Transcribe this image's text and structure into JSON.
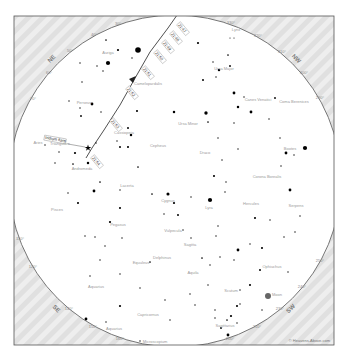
{
  "chart": {
    "colors": {
      "background": "#ffffff",
      "horizon_fill": "#e6e6e6",
      "horizon_line": "#555555",
      "track": "#222222",
      "stars": "#000000",
      "labels": "#9a9a9a"
    },
    "frame": {
      "x": 14,
      "y": 16,
      "w": 320,
      "h": 329
    },
    "sky_circle": {
      "cx": 175,
      "cy": 181,
      "r": 166
    },
    "cardinal_labels": [
      {
        "label": "NE",
        "x": 53,
        "y": 60,
        "rot": -45
      },
      {
        "label": "NW",
        "x": 295,
        "y": 60,
        "rot": 45
      },
      {
        "label": "SE",
        "x": 55,
        "y": 310,
        "rot": 45
      },
      {
        "label": "SW",
        "x": 292,
        "y": 310,
        "rot": -45
      }
    ],
    "degree_labels": [
      {
        "label": "30°",
        "x": 118,
        "y": 25
      },
      {
        "label": "40°",
        "x": 94,
        "y": 36
      },
      {
        "label": "50°",
        "x": 70,
        "y": 52
      },
      {
        "label": "60°",
        "x": 49,
        "y": 74
      },
      {
        "label": "70°",
        "x": 33,
        "y": 100
      },
      {
        "label": "330°",
        "x": 231,
        "y": 24
      },
      {
        "label": "320°",
        "x": 258,
        "y": 37
      },
      {
        "label": "310°",
        "x": 282,
        "y": 53
      },
      {
        "label": "300°",
        "x": 304,
        "y": 74
      },
      {
        "label": "290°",
        "x": 320,
        "y": 99
      },
      {
        "label": "110°",
        "x": 20,
        "y": 240
      },
      {
        "label": "120°",
        "x": 33,
        "y": 268
      },
      {
        "label": "140°",
        "x": 69,
        "y": 310
      },
      {
        "label": "150°",
        "x": 93,
        "y": 328
      },
      {
        "label": "160°",
        "x": 120,
        "y": 340
      },
      {
        "label": "200°",
        "x": 230,
        "y": 340
      },
      {
        "label": "210°",
        "x": 257,
        "y": 328
      },
      {
        "label": "230°",
        "x": 280,
        "y": 310
      },
      {
        "label": "240°",
        "x": 302,
        "y": 288
      },
      {
        "label": "250°",
        "x": 320,
        "y": 262
      }
    ],
    "satellite": {
      "name": "Iridium flare",
      "label": "Iridium flare",
      "track_points": [
        [
          182,
          8
        ],
        [
          168,
          28
        ],
        [
          150,
          52
        ],
        [
          134,
          80
        ],
        [
          120,
          105
        ],
        [
          104,
          130
        ],
        [
          92,
          148
        ],
        [
          86,
          158
        ]
      ],
      "time_labels": [
        {
          "text": "21:47",
          "x": 178,
          "y": 25
        },
        {
          "text": "21:48",
          "x": 171,
          "y": 34
        },
        {
          "text": "21:49",
          "x": 163,
          "y": 43
        },
        {
          "text": "21:50",
          "x": 155,
          "y": 53
        },
        {
          "text": "21:51",
          "x": 143,
          "y": 69
        },
        {
          "text": "21:52",
          "x": 127,
          "y": 89
        },
        {
          "text": "21:53",
          "x": 111,
          "y": 121
        },
        {
          "text": "21:54",
          "x": 92,
          "y": 158
        }
      ],
      "flare_marker": {
        "x": 88,
        "y": 148
      }
    },
    "constellations": [
      {
        "name": "Auriga",
        "x": 108,
        "y": 54
      },
      {
        "name": "Lynx",
        "x": 236,
        "y": 31
      },
      {
        "name": "Camelopardalis",
        "x": 148,
        "y": 85
      },
      {
        "name": "Perseus",
        "x": 84,
        "y": 104
      },
      {
        "name": "Ursa Major",
        "x": 224,
        "y": 70
      },
      {
        "name": "Canes Venatici",
        "x": 258,
        "y": 101
      },
      {
        "name": "Coma Berenices",
        "x": 294,
        "y": 103
      },
      {
        "name": "Ursa Minor",
        "x": 188,
        "y": 125
      },
      {
        "name": "Cassiopeia",
        "x": 124,
        "y": 134
      },
      {
        "name": "Cepheus",
        "x": 158,
        "y": 147
      },
      {
        "name": "Draco",
        "x": 205,
        "y": 154
      },
      {
        "name": "Triangulum",
        "x": 60,
        "y": 145
      },
      {
        "name": "Aries",
        "x": 38,
        "y": 144
      },
      {
        "name": "Andromeda",
        "x": 82,
        "y": 170
      },
      {
        "name": "Bootes",
        "x": 290,
        "y": 150
      },
      {
        "name": "Corona Borealis",
        "x": 267,
        "y": 178
      },
      {
        "name": "Lacerta",
        "x": 127,
        "y": 187
      },
      {
        "name": "Pisces",
        "x": 57,
        "y": 211
      },
      {
        "name": "Cygnus",
        "x": 168,
        "y": 202
      },
      {
        "name": "Lyra",
        "x": 209,
        "y": 209
      },
      {
        "name": "Pegasus",
        "x": 118,
        "y": 226
      },
      {
        "name": "Hercules",
        "x": 251,
        "y": 205
      },
      {
        "name": "Serpens",
        "x": 296,
        "y": 207
      },
      {
        "name": "Vulpecula",
        "x": 173,
        "y": 232
      },
      {
        "name": "Sagitta",
        "x": 190,
        "y": 246
      },
      {
        "name": "Delphinus",
        "x": 162,
        "y": 259
      },
      {
        "name": "Equuleus",
        "x": 141,
        "y": 264
      },
      {
        "name": "Aquila",
        "x": 193,
        "y": 274
      },
      {
        "name": "Ophiuchus",
        "x": 272,
        "y": 268
      },
      {
        "name": "Aquarius",
        "x": 96,
        "y": 288
      },
      {
        "name": "Scutum",
        "x": 231,
        "y": 292
      },
      {
        "name": "Moon",
        "x": 277,
        "y": 296
      },
      {
        "name": "Capricornus",
        "x": 148,
        "y": 316
      },
      {
        "name": "Sagittarius",
        "x": 225,
        "y": 327
      },
      {
        "name": "Aquarius",
        "x": 114,
        "y": 330
      },
      {
        "name": "Microscopium",
        "x": 155,
        "y": 343
      }
    ],
    "moon": {
      "x": 268,
      "y": 296,
      "r": 3
    },
    "stars": [
      [
        106,
        40,
        1.2
      ],
      [
        118,
        50,
        1.6
      ],
      [
        108,
        63,
        3
      ],
      [
        97,
        66,
        1
      ],
      [
        103,
        71,
        1
      ],
      [
        80,
        63,
        1
      ],
      [
        82,
        82,
        1
      ],
      [
        92,
        104,
        2
      ],
      [
        80,
        108,
        1
      ],
      [
        81,
        116,
        1.3
      ],
      [
        69,
        101,
        1
      ],
      [
        101,
        112,
        1
      ],
      [
        132,
        58,
        1
      ],
      [
        138,
        50,
        4
      ],
      [
        203,
        80,
        1.4
      ],
      [
        213,
        62,
        1
      ],
      [
        228,
        55,
        1.2
      ],
      [
        230,
        66,
        1.3
      ],
      [
        219,
        70,
        1.8
      ],
      [
        216,
        77,
        1
      ],
      [
        234,
        93,
        2
      ],
      [
        238,
        107,
        1.8
      ],
      [
        251,
        112,
        2
      ],
      [
        244,
        97,
        1
      ],
      [
        198,
        43,
        1.6
      ],
      [
        230,
        38,
        0.8
      ],
      [
        234,
        38,
        0.8
      ],
      [
        275,
        98,
        1.3
      ],
      [
        269,
        119,
        1
      ],
      [
        286,
        153,
        2
      ],
      [
        305,
        148,
        3
      ],
      [
        294,
        155,
        1
      ],
      [
        281,
        166,
        1
      ],
      [
        290,
        190,
        2
      ],
      [
        280,
        138,
        1
      ],
      [
        174,
        112,
        1.8
      ],
      [
        206,
        113,
        2.4
      ],
      [
        208,
        122,
        1.2
      ],
      [
        234,
        123,
        1
      ],
      [
        218,
        138,
        1
      ],
      [
        238,
        149,
        1
      ],
      [
        222,
        160,
        1
      ],
      [
        214,
        176,
        1.5
      ],
      [
        226,
        182,
        1
      ],
      [
        137,
        111,
        1.5
      ],
      [
        128,
        128,
        1.4
      ],
      [
        131,
        135,
        1.8
      ],
      [
        120,
        147,
        1.4
      ],
      [
        128,
        147,
        1.5
      ],
      [
        117,
        141,
        1
      ],
      [
        138,
        167,
        1.2
      ],
      [
        88,
        163,
        1.8
      ],
      [
        75,
        153,
        1.6
      ],
      [
        73,
        164,
        1.2
      ],
      [
        59,
        152,
        1
      ],
      [
        45,
        145,
        1
      ],
      [
        55,
        163,
        1
      ],
      [
        96,
        143,
        1
      ],
      [
        100,
        182,
        1.2
      ],
      [
        120,
        190,
        1
      ],
      [
        152,
        194,
        1.2
      ],
      [
        168,
        194,
        2.2
      ],
      [
        174,
        203,
        1.6
      ],
      [
        191,
        197,
        1
      ],
      [
        210,
        200,
        3
      ],
      [
        225,
        192,
        1
      ],
      [
        178,
        215,
        1.4
      ],
      [
        218,
        226,
        1
      ],
      [
        164,
        214,
        1
      ],
      [
        94,
        191,
        2
      ],
      [
        120,
        208,
        1.5
      ],
      [
        78,
        203,
        1.5
      ],
      [
        68,
        193,
        1
      ],
      [
        110,
        222,
        1.6
      ],
      [
        85,
        236,
        1
      ],
      [
        95,
        237,
        1
      ],
      [
        105,
        246,
        1
      ],
      [
        122,
        238,
        1
      ],
      [
        100,
        260,
        1
      ],
      [
        90,
        276,
        1
      ],
      [
        120,
        306,
        1.6
      ],
      [
        140,
        288,
        1
      ],
      [
        150,
        262,
        1.2
      ],
      [
        183,
        230,
        1
      ],
      [
        191,
        238,
        1
      ],
      [
        216,
        236,
        1
      ],
      [
        234,
        260,
        1
      ],
      [
        238,
        250,
        2
      ],
      [
        250,
        244,
        1
      ],
      [
        262,
        248,
        1.5
      ],
      [
        284,
        237,
        1
      ],
      [
        255,
        218,
        1.5
      ],
      [
        270,
        220,
        1
      ],
      [
        295,
        232,
        1
      ],
      [
        300,
        216,
        1
      ],
      [
        202,
        258,
        1.2
      ],
      [
        210,
        265,
        1
      ],
      [
        220,
        257,
        1
      ],
      [
        208,
        285,
        1
      ],
      [
        240,
        290,
        1
      ],
      [
        262,
        310,
        1
      ],
      [
        215,
        310,
        1
      ],
      [
        227,
        320,
        1.2
      ],
      [
        231,
        316,
        1.6
      ],
      [
        237,
        323,
        1
      ],
      [
        240,
        304,
        1
      ],
      [
        221,
        328,
        1.3
      ],
      [
        228,
        335,
        2
      ],
      [
        215,
        318,
        1
      ],
      [
        86,
        319,
        2
      ],
      [
        140,
        341,
        1
      ],
      [
        106,
        322,
        1
      ],
      [
        165,
        300,
        1
      ],
      [
        170,
        320,
        1
      ],
      [
        190,
        294,
        1
      ],
      [
        195,
        305,
        1
      ],
      [
        120,
        274,
        1
      ],
      [
        260,
        270,
        1.4
      ],
      [
        288,
        272,
        1
      ],
      [
        250,
        285,
        1.5
      ],
      [
        237,
        306,
        1.5
      ]
    ],
    "credit": "© Heavens-Above.com"
  }
}
